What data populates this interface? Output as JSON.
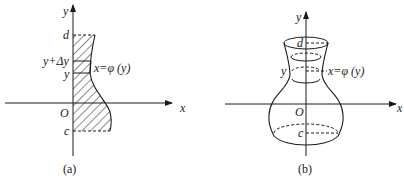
{
  "panel_a": {
    "caption": "(a)",
    "axis_x_label": "x",
    "axis_y_label": "y",
    "origin_label": "O",
    "top_label": "d",
    "bottom_label": "c",
    "strip_top_label": "y+Δy",
    "strip_bottom_label": "y",
    "curve_label": "x=φ (y)"
  },
  "panel_b": {
    "caption": "(b)",
    "axis_x_label": "x",
    "axis_y_label": "y",
    "origin_label": "O",
    "top_label": "d",
    "bottom_label": "c",
    "slice_label": "y",
    "curve_label": "x=φ (y)"
  },
  "colors": {
    "ink": "#1a1a1a",
    "background": "#ffffff"
  }
}
